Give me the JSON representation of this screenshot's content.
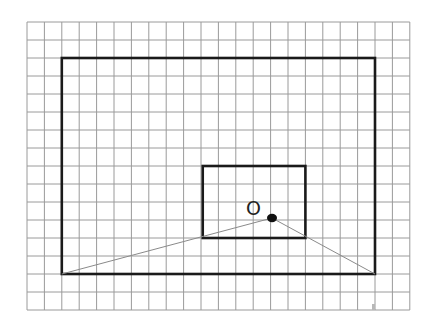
{
  "grid": {
    "origin_x": 27,
    "origin_y": 22,
    "cell_w": 17.4,
    "cell_h": 18,
    "cols": 22,
    "rows": 16,
    "line_color": "#9a9a9a"
  },
  "outer_rect": {
    "col0": 2,
    "row0": 2,
    "col1": 20,
    "row1": 14,
    "color": "#1a1a1a"
  },
  "inner_rect": {
    "col0": 10.1,
    "row0": 8,
    "col1": 16,
    "row1": 12,
    "color": "#1a1a1a"
  },
  "point": {
    "label": "O",
    "x": 272,
    "y": 218
  },
  "segments": [
    {
      "from": "outer_bottom_left",
      "to": "point"
    },
    {
      "from": "point",
      "to": "outer_bottom_right"
    }
  ],
  "segment_color": "#8a8a8a"
}
